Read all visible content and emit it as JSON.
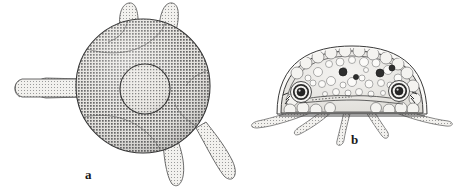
{
  "plate": {
    "name": "two-panel-zoological-figure",
    "background_color": "#ffffff",
    "ink_color": "#2b2b2b",
    "width": 454,
    "height": 192
  },
  "figures": [
    {
      "key": "a",
      "label": "a",
      "label_x": 85,
      "label_y": 168,
      "view": "aboral view of circular umbrella body with radiating tentacles",
      "body": {
        "shape": "circle",
        "cx": 143,
        "cy": 86,
        "r": 67,
        "fill": "#d8d6d2",
        "stroke": "#3a3a3a",
        "texture": "fine halftone stipple"
      },
      "inner_ring": {
        "shape": "circle",
        "cx": 145,
        "cy": 89,
        "r": 25,
        "stroke": "#3f3f3f",
        "fill": "#cfcdc9"
      },
      "tentacles": [
        {
          "name": "tentacle-left",
          "cx": 45,
          "cy": 88,
          "rx": 38,
          "ry": 9,
          "rot": -2
        },
        {
          "name": "tentacle-top-left",
          "cx": 128,
          "cy": 13,
          "rx": 8,
          "ry": 14,
          "rot": -8
        },
        {
          "name": "tentacle-top-right",
          "cx": 167,
          "cy": 12,
          "rx": 8,
          "ry": 14,
          "rot": 10
        },
        {
          "name": "tentacle-bottom-mid",
          "cx": 176,
          "cy": 163,
          "rx": 9,
          "ry": 25,
          "rot": 12
        },
        {
          "name": "tentacle-bottom-right",
          "cx": 212,
          "cy": 155,
          "rx": 9,
          "ry": 27,
          "rot": 35
        }
      ]
    },
    {
      "key": "b",
      "label": "b",
      "label_x": 351,
      "label_y": 133,
      "view": "lateral optical section showing dome body, double outer membrane, vesicles, paired statocysts and tentacles",
      "body": {
        "shape": "dome",
        "cx": 352,
        "cy": 90,
        "rx": 73,
        "ry": 40,
        "fill": "#e6e4e0",
        "stroke": "#3a3a3a"
      },
      "outer_membranes": 2,
      "baseline_y": 116,
      "statocysts": [
        {
          "name": "statocyst-left",
          "cx": 301,
          "cy": 92,
          "r_outer": 10,
          "r_mid": 7,
          "r_inner": 4,
          "fill": "#2f2f2f"
        },
        {
          "name": "statocyst-right",
          "cx": 399,
          "cy": 91,
          "r_outer": 10,
          "r_mid": 7,
          "r_inner": 4,
          "fill": "#2f2f2f"
        }
      ],
      "dark_vesicles": [
        {
          "cx": 343,
          "cy": 72,
          "r": 4
        },
        {
          "cx": 380,
          "cy": 73,
          "r": 4
        },
        {
          "cx": 392,
          "cy": 69,
          "r": 3
        },
        {
          "cx": 354,
          "cy": 78,
          "r": 3
        }
      ],
      "light_vesicles_count": 28,
      "tentacles": [
        {
          "name": "tentacle-b-far-left",
          "x1": 300,
          "y1": 110,
          "x2": 256,
          "y2": 124,
          "w": 7
        },
        {
          "name": "tentacle-b-left",
          "x1": 334,
          "y1": 112,
          "x2": 297,
          "y2": 134,
          "w": 7
        },
        {
          "name": "tentacle-b-center",
          "x1": 349,
          "y1": 112,
          "x2": 338,
          "y2": 142,
          "w": 8
        },
        {
          "name": "tentacle-b-right",
          "x1": 364,
          "y1": 112,
          "x2": 383,
          "y2": 138,
          "w": 7
        },
        {
          "name": "tentacle-b-far-right",
          "x1": 402,
          "y1": 110,
          "x2": 450,
          "y2": 122,
          "w": 7
        }
      ]
    }
  ]
}
